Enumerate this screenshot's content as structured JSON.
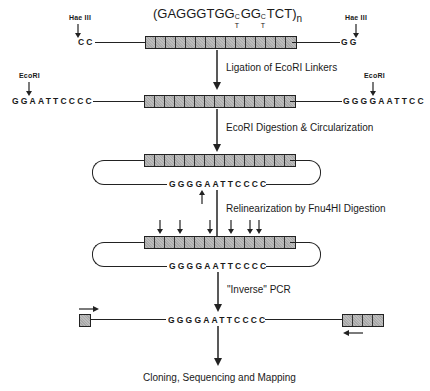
{
  "title": {
    "prefix": "(GAGGGTGG",
    "wobble1_top": "C",
    "wobble1_bottom": "T",
    "middle": "GG",
    "wobble2_top": "C",
    "wobble2_bottom": "T",
    "suffix": "TCT)",
    "subscript": "n"
  },
  "row1": {
    "left_enzyme": "Hae III",
    "right_enzyme": "Hae III",
    "left_end": "CC",
    "right_end": "GG",
    "repeat_units": 15
  },
  "steps": [
    "Ligation of EcoRI Linkers",
    "EcoRI Digestion & Circularization",
    "Relinearization by Fnu4HI Digestion",
    "\"Inverse\" PCR",
    "Cloning, Sequencing and Mapping"
  ],
  "row2": {
    "left_enzyme": "EcoRI",
    "right_enzyme": "EcoRI",
    "left_seq": "GGAATTCCCC",
    "right_seq": "GGGGAATTCC",
    "repeat_units": 15
  },
  "circle1": {
    "junction_seq": "GGGGAATTCCCC",
    "repeat_units": 15
  },
  "circle2": {
    "junction_seq": "GGGGAATTCCCC",
    "repeat_units": 15,
    "cut_arrows": 6
  },
  "pcr": {
    "junction_seq": "GGGGAATTCCCC",
    "left_units": 1,
    "right_units": 4
  }
}
